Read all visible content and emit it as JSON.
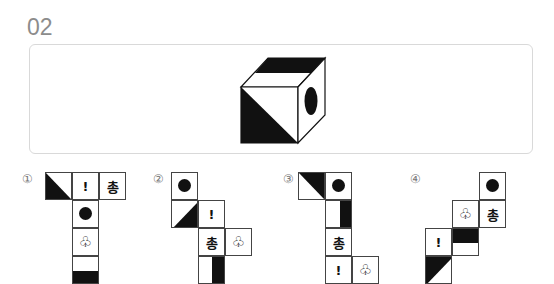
{
  "question": {
    "number": "02"
  },
  "cube": {
    "description": "isometric cube: top face has black back band, front face lower-left triangle black, right face has black ellipse"
  },
  "options": [
    {
      "label": "①",
      "cells": [
        {
          "col": 0,
          "row": 0,
          "content": "diag-bottom-left-black"
        },
        {
          "col": 1,
          "row": 0,
          "content": "!"
        },
        {
          "col": 2,
          "row": 0,
          "content": "총"
        },
        {
          "col": 1,
          "row": 1,
          "content": "circle"
        },
        {
          "col": 1,
          "row": 2,
          "content": "♧"
        },
        {
          "col": 1,
          "row": 3,
          "content": "bottom-half-black"
        }
      ]
    },
    {
      "label": "②",
      "cells": [
        {
          "col": 0,
          "row": 0,
          "content": "circle"
        },
        {
          "col": 0,
          "row": 1,
          "content": "diag-bottom-right-black"
        },
        {
          "col": 1,
          "row": 1,
          "content": "!"
        },
        {
          "col": 1,
          "row": 2,
          "content": "총"
        },
        {
          "col": 2,
          "row": 2,
          "content": "♧"
        },
        {
          "col": 1,
          "row": 3,
          "content": "right-half-black"
        }
      ]
    },
    {
      "label": "③",
      "cells": [
        {
          "col": 0,
          "row": 0,
          "content": "diag-top-right-black"
        },
        {
          "col": 1,
          "row": 0,
          "content": "circle"
        },
        {
          "col": 1,
          "row": 1,
          "content": "right-half-black"
        },
        {
          "col": 1,
          "row": 2,
          "content": "총"
        },
        {
          "col": 1,
          "row": 3,
          "content": "!"
        },
        {
          "col": 2,
          "row": 3,
          "content": "♧"
        }
      ]
    },
    {
      "label": "④",
      "cells": [
        {
          "col": 2,
          "row": 0,
          "content": "circle"
        },
        {
          "col": 1,
          "row": 1,
          "content": "♧"
        },
        {
          "col": 2,
          "row": 1,
          "content": "총"
        },
        {
          "col": 0,
          "row": 2,
          "content": "!"
        },
        {
          "col": 1,
          "row": 2,
          "content": "top-half-black"
        },
        {
          "col": 0,
          "row": 3,
          "content": "diag-bottom-left-black-tr"
        }
      ]
    }
  ]
}
